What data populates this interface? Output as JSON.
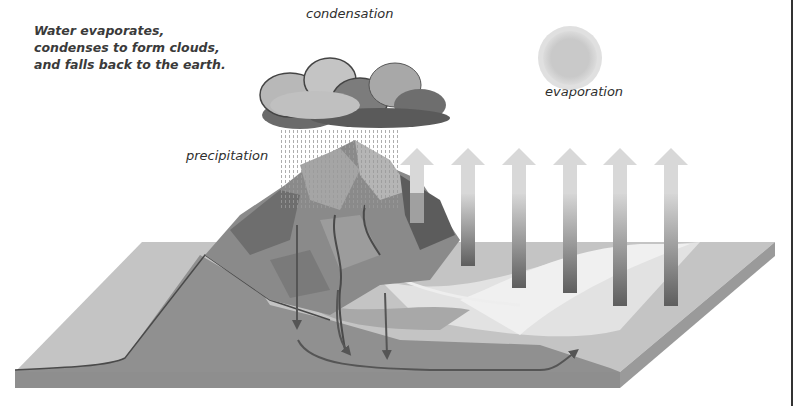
{
  "caption": "Water evaporates, condenses to form clouds, and falls back to the earth.",
  "labels": {
    "condensation": "condensation",
    "evaporation": "evaporation",
    "precipitation": "precipitation"
  },
  "components": {
    "cloud": "storm-cloud",
    "sun": "sun",
    "rain": "rain-dots",
    "mountain": "mountain-range",
    "evaporation_arrows": 6,
    "groundwater_arrows": 4,
    "land_block": "cross-section-land-slab"
  },
  "colors": {
    "background": "#ffffff",
    "text": "#333333",
    "land_top": "#c8c8c8",
    "land_side": "#9a9a9a",
    "soil_cross_section": "#8f8f8f",
    "arrow_dark": "#555555",
    "sun": "#cfcfcf"
  }
}
